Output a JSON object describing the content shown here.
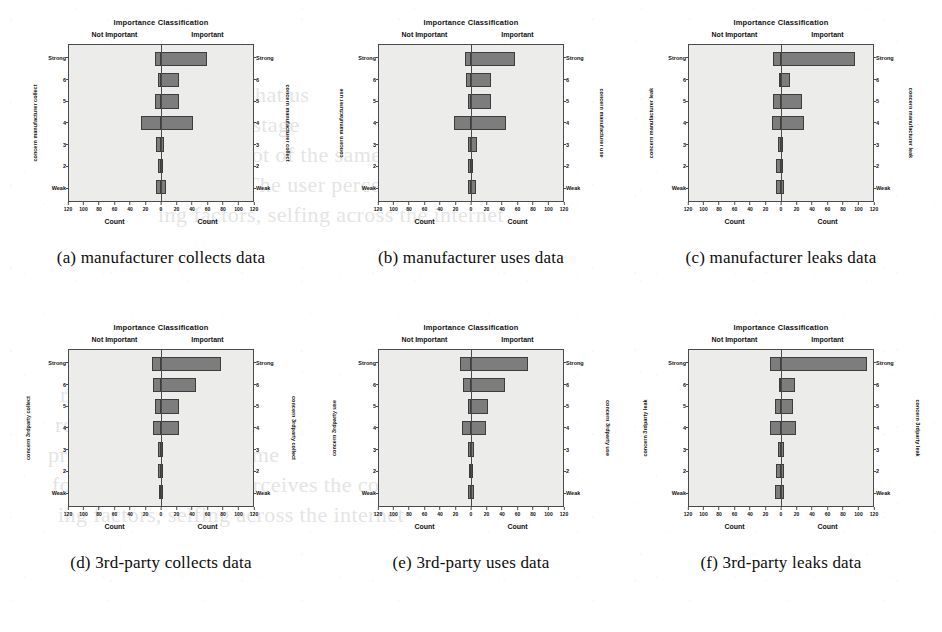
{
  "figure": {
    "panel_count": 6,
    "shared": {
      "chart_title": "Importance Classification",
      "class_left": "Not Important",
      "class_right": "Important",
      "x_axis_label_left": "Count",
      "x_axis_label_right": "Count",
      "y_tick_labels": [
        "Strong",
        "6",
        "5",
        "4",
        "3",
        "2",
        "Weak"
      ],
      "x_tick_labels": [
        "120",
        "100",
        "80",
        "60",
        "40",
        "20",
        "0",
        "20",
        "40",
        "60",
        "80",
        "100",
        "120"
      ],
      "x_tick_values": [
        -120,
        -100,
        -80,
        -60,
        -40,
        -20,
        0,
        20,
        40,
        60,
        80,
        100,
        120
      ],
      "bar_color": "#7d7d7d",
      "bar_edge_color": "#3d3d3d",
      "plot_background": "#ececeb",
      "axis_color": "#4a4a4a"
    },
    "panels": [
      {
        "id": "a",
        "caption": "(a) manufacturer collects data",
        "y_axis_title": "concern manufacturer collect"
      },
      {
        "id": "b",
        "caption": "(b) manufacturer uses data",
        "y_axis_title": "concern manufacturer use"
      },
      {
        "id": "c",
        "caption": "(c) manufacturer leaks data",
        "y_axis_title": "concern manufacturer leak"
      },
      {
        "id": "d",
        "caption": "(d) 3rd-party collects data",
        "y_axis_title": "concern 3rdparty collect"
      },
      {
        "id": "e",
        "caption": "(e) 3rd-party uses data",
        "y_axis_title": "concern 3rdparty use"
      },
      {
        "id": "f",
        "caption": "(f) 3rd-party leaks data",
        "y_axis_title": "concern 3rdparty leak"
      }
    ]
  },
  "chart_data": [
    {
      "type": "bar",
      "subtype": "diverging-horizontal",
      "id": "a",
      "title": "Importance Classification",
      "caption": "(a) manufacturer collects data",
      "xlabel": "Count",
      "ylabel": "concern manufacturer collect",
      "categories": [
        "Strong",
        "6",
        "5",
        "4",
        "3",
        "2",
        "Weak"
      ],
      "series": [
        {
          "name": "Not Important",
          "values": [
            8,
            4,
            8,
            26,
            6,
            4,
            6
          ]
        },
        {
          "name": "Important",
          "values": [
            60,
            24,
            24,
            42,
            4,
            2,
            6
          ]
        }
      ],
      "xlim": [
        -120,
        120
      ],
      "grid": false,
      "legend": "none",
      "axis_ticks": [
        -120,
        -100,
        -80,
        -60,
        -40,
        -20,
        0,
        20,
        40,
        60,
        80,
        100,
        120
      ]
    },
    {
      "type": "bar",
      "subtype": "diverging-horizontal",
      "id": "b",
      "title": "Importance Classification",
      "caption": "(b) manufacturer uses data",
      "xlabel": "Count",
      "ylabel": "concern manufacturer use",
      "categories": [
        "Strong",
        "6",
        "5",
        "4",
        "3",
        "2",
        "Weak"
      ],
      "series": [
        {
          "name": "Not Important",
          "values": [
            8,
            6,
            4,
            22,
            4,
            4,
            4
          ]
        },
        {
          "name": "Important",
          "values": [
            58,
            26,
            26,
            46,
            8,
            2,
            6
          ]
        }
      ],
      "xlim": [
        -120,
        120
      ],
      "grid": false,
      "legend": "none",
      "axis_ticks": [
        -120,
        -100,
        -80,
        -60,
        -40,
        -20,
        0,
        20,
        40,
        60,
        80,
        100,
        120
      ]
    },
    {
      "type": "bar",
      "subtype": "diverging-horizontal",
      "id": "c",
      "title": "Importance Classification",
      "caption": "(c) manufacturer leaks data",
      "xlabel": "Count",
      "ylabel": "concern manufacturer leak",
      "categories": [
        "Strong",
        "6",
        "5",
        "4",
        "3",
        "2",
        "Weak"
      ],
      "series": [
        {
          "name": "Not Important",
          "values": [
            10,
            2,
            10,
            12,
            4,
            6,
            6
          ]
        },
        {
          "name": "Important",
          "values": [
            96,
            12,
            28,
            30,
            2,
            2,
            4
          ]
        }
      ],
      "xlim": [
        -120,
        120
      ],
      "grid": false,
      "legend": "none",
      "axis_ticks": [
        -120,
        -100,
        -80,
        -60,
        -40,
        -20,
        0,
        20,
        40,
        60,
        80,
        100,
        120
      ]
    },
    {
      "type": "bar",
      "subtype": "diverging-horizontal",
      "id": "d",
      "title": "Importance Classification",
      "caption": "(d) 3rd-party collects data",
      "xlabel": "Count",
      "ylabel": "concern 3rdparty collect",
      "categories": [
        "Strong",
        "6",
        "5",
        "4",
        "3",
        "2",
        "Weak"
      ],
      "series": [
        {
          "name": "Not Important",
          "values": [
            12,
            10,
            8,
            10,
            4,
            4,
            2
          ]
        },
        {
          "name": "Important",
          "values": [
            78,
            46,
            24,
            24,
            2,
            2,
            2
          ]
        }
      ],
      "xlim": [
        -120,
        120
      ],
      "grid": false,
      "legend": "none",
      "axis_ticks": [
        -120,
        -100,
        -80,
        -60,
        -40,
        -20,
        0,
        20,
        40,
        60,
        80,
        100,
        120
      ]
    },
    {
      "type": "bar",
      "subtype": "diverging-horizontal",
      "id": "e",
      "title": "Importance Classification",
      "caption": "(e) 3rd-party uses data",
      "xlabel": "Count",
      "ylabel": "concern 3rdparty use",
      "categories": [
        "Strong",
        "6",
        "5",
        "4",
        "3",
        "2",
        "Weak"
      ],
      "series": [
        {
          "name": "Not Important",
          "values": [
            14,
            10,
            4,
            12,
            4,
            2,
            4
          ]
        },
        {
          "name": "Important",
          "values": [
            74,
            44,
            22,
            20,
            4,
            2,
            4
          ]
        }
      ],
      "xlim": [
        -120,
        120
      ],
      "grid": false,
      "legend": "none",
      "axis_ticks": [
        -120,
        -100,
        -80,
        -60,
        -40,
        -20,
        0,
        20,
        40,
        60,
        80,
        100,
        120
      ]
    },
    {
      "type": "bar",
      "subtype": "diverging-horizontal",
      "id": "f",
      "title": "Importance Classification",
      "caption": "(f) 3rd-party leaks data",
      "xlabel": "Count",
      "ylabel": "concern 3rdparty leak",
      "categories": [
        "Strong",
        "6",
        "5",
        "4",
        "3",
        "2",
        "Weak"
      ],
      "series": [
        {
          "name": "Not Important",
          "values": [
            14,
            2,
            8,
            14,
            4,
            6,
            8
          ]
        },
        {
          "name": "Important",
          "values": [
            112,
            18,
            16,
            20,
            4,
            4,
            4
          ]
        }
      ],
      "xlim": [
        -120,
        120
      ],
      "grid": false,
      "legend": "none",
      "axis_ticks": [
        -120,
        -100,
        -80,
        -60,
        -40,
        -20,
        0,
        20,
        40,
        60,
        80,
        100,
        120
      ]
    }
  ],
  "bleed_through_text": [
    "revealed that us",
    "really the stage",
    "privacy, a lot of the same",
    "for using. The user perceives the conn",
    "ing factors, selfing across the internet"
  ]
}
